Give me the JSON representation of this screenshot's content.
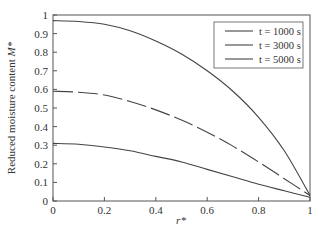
{
  "chart_data": {
    "type": "line",
    "title": "",
    "xlabel": "r*",
    "ylabel": "Reduced moisture content M*",
    "xlim": [
      0,
      1
    ],
    "ylim": [
      0,
      1
    ],
    "xticks": [
      "0",
      "0.2",
      "0.4",
      "0.6",
      "0.8",
      "1"
    ],
    "yticks": [
      "0",
      "0.1",
      "0.2",
      "0.3",
      "0.4",
      "0.5",
      "0.6",
      "0.7",
      "0.8",
      "0.9",
      "1"
    ],
    "grid": false,
    "legend_position": "upper right",
    "x": [
      0,
      0.1,
      0.2,
      0.3,
      0.4,
      0.5,
      0.6,
      0.7,
      0.8,
      0.9,
      1.0
    ],
    "series": [
      {
        "name": "t = 1000 s",
        "style": "solid",
        "values": [
          0.97,
          0.965,
          0.95,
          0.915,
          0.86,
          0.79,
          0.7,
          0.59,
          0.45,
          0.27,
          0.03
        ]
      },
      {
        "name": "t = 3000 s",
        "style": "dashed",
        "values": [
          0.59,
          0.585,
          0.57,
          0.535,
          0.49,
          0.435,
          0.37,
          0.295,
          0.21,
          0.12,
          0.03
        ]
      },
      {
        "name": "t = 5000 s",
        "style": "solid",
        "values": [
          0.31,
          0.305,
          0.29,
          0.27,
          0.24,
          0.21,
          0.17,
          0.13,
          0.09,
          0.055,
          0.02
        ]
      }
    ]
  },
  "legend": {
    "items": [
      "t = 1000 s",
      "t = 3000 s",
      "t = 5000 s"
    ]
  },
  "axes": {
    "xlabel": "r*",
    "ylabel_main": "Reduced moisture content ",
    "ylabel_var": "M*"
  }
}
